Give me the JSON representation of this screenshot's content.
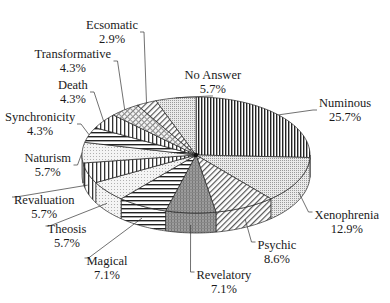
{
  "chart_data": {
    "type": "pie",
    "style": "3d-exploded-none, black-and-white hatch patterns",
    "title": "",
    "start_angle_deg": 0,
    "direction": "clockwise",
    "slices": [
      {
        "label": "Numinous",
        "value": 25.7,
        "display": "25.7%",
        "pattern": "vlines-dense",
        "label_pos": {
          "x": 345,
          "y": 96
        }
      },
      {
        "label": "Xenophrenia",
        "value": 12.9,
        "display": "12.9%",
        "pattern": "dots-fine",
        "label_pos": {
          "x": 347,
          "y": 208
        }
      },
      {
        "label": "Psychic",
        "value": 8.6,
        "display": "8.6%",
        "pattern": "diag",
        "label_pos": {
          "x": 277,
          "y": 238
        }
      },
      {
        "label": "Revelatory",
        "value": 7.1,
        "display": "7.1%",
        "pattern": "dark-grid",
        "label_pos": {
          "x": 224,
          "y": 268
        }
      },
      {
        "label": "Magical",
        "value": 7.1,
        "display": "7.1%",
        "pattern": "hlines",
        "label_pos": {
          "x": 107,
          "y": 254
        }
      },
      {
        "label": "Theosis",
        "value": 5.7,
        "display": "5.7%",
        "pattern": "dots-light",
        "label_pos": {
          "x": 67,
          "y": 222
        }
      },
      {
        "label": "Revaluation",
        "value": 5.7,
        "display": "5.7%",
        "pattern": "vlines",
        "label_pos": {
          "x": 44,
          "y": 193
        }
      },
      {
        "label": "Naturism",
        "value": 5.7,
        "display": "5.7%",
        "pattern": "dots-light",
        "label_pos": {
          "x": 48,
          "y": 151
        }
      },
      {
        "label": "Synchronicity",
        "value": 4.3,
        "display": "4.3%",
        "pattern": "hlines",
        "label_pos": {
          "x": 40,
          "y": 110
        }
      },
      {
        "label": "Death",
        "value": 4.3,
        "display": "4.3%",
        "pattern": "vlines",
        "label_pos": {
          "x": 73,
          "y": 78
        }
      },
      {
        "label": "Transformative",
        "value": 4.3,
        "display": "4.3%",
        "pattern": "crosshatch",
        "label_pos": {
          "x": 73,
          "y": 47
        }
      },
      {
        "label": "Ecsomatic",
        "value": 2.9,
        "display": "2.9%",
        "pattern": "diag",
        "label_pos": {
          "x": 112,
          "y": 18
        }
      },
      {
        "label": "No Answer",
        "value": 5.7,
        "display": "5.7%",
        "pattern": "dots-fine",
        "label_pos": {
          "x": 213,
          "y": 68
        }
      }
    ],
    "legend": "none (callout labels with leader lines)"
  },
  "labels": [
    {
      "name": "Numinous",
      "pct": "25.7%"
    },
    {
      "name": "Xenophrenia",
      "pct": "12.9%"
    },
    {
      "name": "Psychic",
      "pct": "8.6%"
    },
    {
      "name": "Revelatory",
      "pct": "7.1%"
    },
    {
      "name": "Magical",
      "pct": "7.1%"
    },
    {
      "name": "Theosis",
      "pct": "5.7%"
    },
    {
      "name": "Revaluation",
      "pct": "5.7%"
    },
    {
      "name": "Naturism",
      "pct": "5.7%"
    },
    {
      "name": "Synchronicity",
      "pct": "4.3%"
    },
    {
      "name": "Death",
      "pct": "4.3%"
    },
    {
      "name": "Transformative",
      "pct": "4.3%"
    },
    {
      "name": "Ecsomatic",
      "pct": "2.9%"
    },
    {
      "name": "No Answer",
      "pct": "5.7%"
    }
  ]
}
